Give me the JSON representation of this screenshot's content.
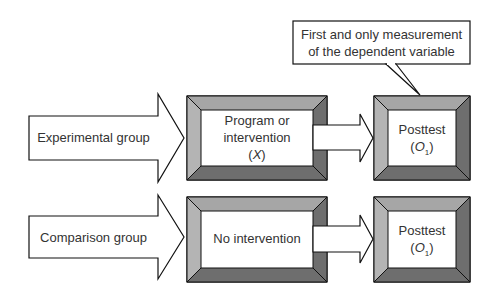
{
  "callout": {
    "line1": "First and only measurement",
    "line2": "of the dependent variable"
  },
  "rows": [
    {
      "group_label": "Experimental group",
      "treatment_line1": "Program or",
      "treatment_line2": "intervention",
      "treatment_symbol": "X",
      "outcome_label": "Posttest",
      "outcome_symbol": "O",
      "outcome_subscript": "1"
    },
    {
      "group_label": "Comparison group",
      "treatment_line1": "No intervention",
      "outcome_label": "Posttest",
      "outcome_symbol": "O",
      "outcome_subscript": "1"
    }
  ],
  "colors": {
    "bevel_light": "#b4b4b4",
    "bevel_top": "#a6a6a6",
    "bevel_dark": "#6e6e6e",
    "stroke": "#111111",
    "fill": "#ffffff"
  }
}
